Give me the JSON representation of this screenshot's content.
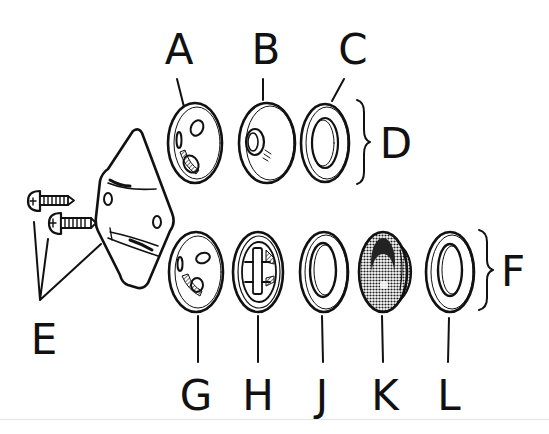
{
  "figure": {
    "type": "exploded-parts-diagram",
    "colors": {
      "ink": "#111111",
      "background": "#ffffff",
      "shading": "#555555"
    }
  },
  "labels": {
    "A": "A",
    "B": "B",
    "C": "C",
    "D": "D",
    "E": "E",
    "F": "F",
    "G": "G",
    "H": "H",
    "J": "J",
    "K": "K",
    "L": "L"
  },
  "groups": {
    "D": {
      "label": "D",
      "members": [
        "A",
        "B",
        "C"
      ]
    },
    "F": {
      "label": "F",
      "members": [
        "J",
        "K",
        "L"
      ]
    }
  },
  "parts": [
    {
      "id": "A",
      "row": "top",
      "shape": "disc with holes"
    },
    {
      "id": "B",
      "row": "top",
      "shape": "disc with center boss"
    },
    {
      "id": "C",
      "row": "top",
      "shape": "flat washer"
    },
    {
      "id": "E",
      "row": "left",
      "shape": "two screws and mounting bracket"
    },
    {
      "id": "G",
      "row": "bottom",
      "shape": "disc with holes"
    },
    {
      "id": "H",
      "row": "bottom",
      "shape": "disc with slotted center"
    },
    {
      "id": "J",
      "row": "bottom",
      "shape": "flat washer"
    },
    {
      "id": "K",
      "row": "bottom",
      "shape": "shaded cup/grommet"
    },
    {
      "id": "L",
      "row": "bottom",
      "shape": "flat washer"
    }
  ]
}
